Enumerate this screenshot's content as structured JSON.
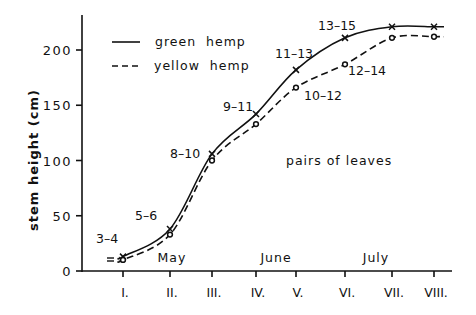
{
  "chart_data": {
    "type": "line",
    "title": "",
    "xlabel": "",
    "ylabel": "stem height (cm)",
    "ylim": [
      0,
      225
    ],
    "yticks": [
      0,
      50,
      100,
      150,
      200
    ],
    "categories": [
      "I.",
      "II.",
      "III.",
      "IV.",
      "V.",
      "VI.",
      "VII.",
      "VIII."
    ],
    "month_labels": [
      {
        "label": "May",
        "near": "II."
      },
      {
        "label": "June",
        "near": "IV."
      },
      {
        "label": "July",
        "near": "VI."
      }
    ],
    "series": [
      {
        "name": "green hemp",
        "style": "solid",
        "marker": "x",
        "values": [
          13,
          38,
          106,
          142,
          182,
          211,
          221,
          221
        ]
      },
      {
        "name": "yellow hemp",
        "style": "dashed",
        "marker": "o",
        "values": [
          10,
          33,
          100,
          133,
          166,
          187,
          211,
          212
        ]
      }
    ],
    "annotations": [
      {
        "text": "3-4",
        "category": "I."
      },
      {
        "text": "5-6",
        "category": "II."
      },
      {
        "text": "8-10",
        "category": "III."
      },
      {
        "text": "9-11",
        "category": "IV."
      },
      {
        "text": "11-13",
        "category": "V."
      },
      {
        "text": "10-12",
        "category": "V."
      },
      {
        "text": "13-15",
        "category": "VI."
      },
      {
        "text": "12-14",
        "category": "VI."
      },
      {
        "text": "pairs of leaves",
        "category": ""
      }
    ],
    "legend_position": "top-left",
    "grid": false
  },
  "legend": {
    "green_label": "green  hemp",
    "yellow_label": "yellow  hemp"
  },
  "labels": {
    "ylabel": "stem height (cm)",
    "pairs_of_leaves": "pairs of leaves"
  }
}
